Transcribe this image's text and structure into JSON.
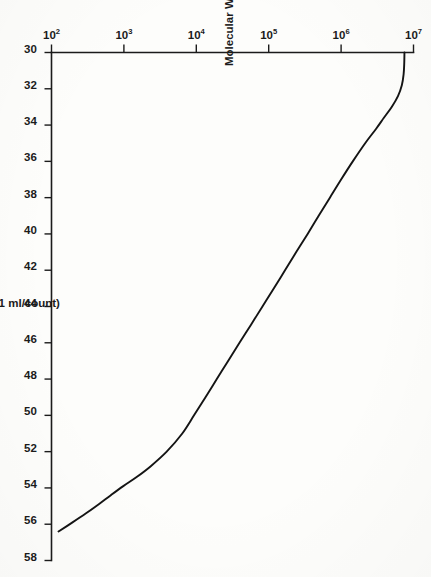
{
  "figure": {
    "rotation_degrees": 90,
    "background_color": "#fdfdfb",
    "ink_color": "#141414",
    "caption_fragment": "Figure 3.  Calibration curve"
  },
  "chart_data": {
    "type": "line",
    "title": "",
    "subtitle": "",
    "xlabel": "Count (0.11 ml/count)",
    "ylabel": "Molecular Weight",
    "xscale": "linear",
    "yscale": "log",
    "xlim": [
      30,
      58
    ],
    "ylim": [
      100,
      10000000
    ],
    "grid": false,
    "legend": null,
    "legend_position": "none",
    "x_ticks": [
      30,
      32,
      34,
      36,
      38,
      40,
      42,
      44,
      46,
      48,
      50,
      52,
      54,
      56,
      58
    ],
    "x_tick_labels": [
      "30",
      "32",
      "34",
      "36",
      "38",
      "40",
      "42",
      "44",
      "46",
      "48",
      "50",
      "52",
      "54",
      "56",
      "58"
    ],
    "y_ticks": [
      100,
      1000,
      10000,
      100000,
      1000000,
      10000000
    ],
    "y_tick_labels": [
      "10²",
      "10³",
      "10⁴",
      "10⁵",
      "10⁶",
      "10⁷"
    ],
    "y_tick_mantissa": [
      "10",
      "10",
      "10",
      "10",
      "10",
      "10"
    ],
    "y_tick_exponents": [
      "2",
      "3",
      "4",
      "5",
      "6",
      "7"
    ],
    "series": [
      {
        "name": "Calibration curve",
        "color": "#141414",
        "linewidth": 1.9,
        "marker": "none",
        "x": [
          30.0,
          30.6,
          31.2,
          31.8,
          32.4,
          33.0,
          33.6,
          34.2,
          35.0,
          36.0,
          37.0,
          38.0,
          39.0,
          40.0,
          41.0,
          42.0,
          43.0,
          44.0,
          45.0,
          46.0,
          47.0,
          48.0,
          49.0,
          50.0,
          51.0,
          52.0,
          52.8,
          53.4,
          53.9,
          54.4,
          54.9,
          55.4,
          55.9,
          56.4
        ],
        "y": [
          7500000,
          7450000,
          7300000,
          6900000,
          6100000,
          5000000,
          3900000,
          3050000,
          2150000,
          1450000,
          1000000,
          700000,
          490000,
          345000,
          240000,
          168000,
          118000,
          82000,
          57000,
          39500,
          27500,
          19200,
          13400,
          9300,
          6400,
          3900,
          2350,
          1500,
          980,
          660,
          450,
          300,
          195,
          125
        ]
      }
    ],
    "annotations": []
  }
}
